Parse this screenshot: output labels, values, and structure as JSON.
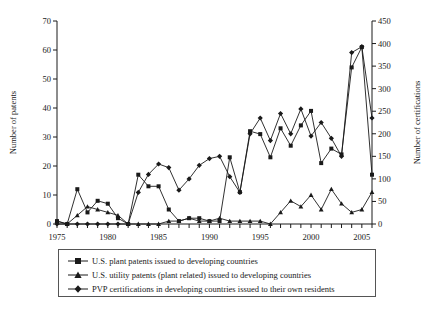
{
  "chart_data": {
    "type": "line",
    "title": "",
    "xlabel": "",
    "ylabel": "Number of patents",
    "y2label": "Number of certifications",
    "xlim": [
      1975,
      2006
    ],
    "ylim": [
      0,
      70
    ],
    "y2lim": [
      0,
      450
    ],
    "grid": false,
    "legend_position": "bottom",
    "xticks": [
      1975,
      1980,
      1985,
      1990,
      1995,
      2000,
      2005
    ],
    "xtick_labels": [
      "1975",
      "1980",
      "1985",
      "1990",
      "1995",
      "2000",
      "2005"
    ],
    "yticks": [
      0,
      10,
      20,
      30,
      40,
      50,
      60,
      70
    ],
    "ytick_labels": [
      "0",
      "10",
      "20",
      "30",
      "40",
      "50",
      "60",
      "70"
    ],
    "y2ticks": [
      0,
      50,
      100,
      150,
      200,
      250,
      300,
      350,
      400,
      450
    ],
    "y2tick_labels": [
      "0",
      "50",
      "100",
      "150",
      "200",
      "250",
      "300",
      "350",
      "400",
      "450"
    ],
    "x": [
      1975,
      1976,
      1977,
      1978,
      1979,
      1980,
      1981,
      1982,
      1983,
      1984,
      1985,
      1986,
      1987,
      1988,
      1989,
      1990,
      1991,
      1992,
      1993,
      1994,
      1995,
      1996,
      1997,
      1998,
      1999,
      2000,
      2001,
      2002,
      2003,
      2004,
      2005,
      2006
    ],
    "series": [
      {
        "name": "U.S. plant patents issued to developing countries",
        "marker": "square",
        "axis": "left",
        "values": [
          1,
          0,
          12,
          4,
          8,
          7,
          2,
          0,
          17,
          13,
          13,
          5,
          1,
          2,
          2,
          1,
          1,
          23,
          11,
          32,
          31,
          23,
          33,
          27,
          34,
          39,
          21,
          26,
          24,
          54,
          61,
          17
        ]
      },
      {
        "name": "U.S. utility patents (plant related)  issued to developing countries",
        "marker": "triangle",
        "axis": "left",
        "values": [
          1,
          0,
          3,
          6,
          5,
          4,
          3,
          0,
          0,
          0,
          0,
          1,
          1,
          2,
          1,
          1,
          2,
          1,
          1,
          1,
          1,
          0,
          4,
          8,
          6,
          10,
          5,
          12,
          7,
          4,
          5,
          11
        ]
      },
      {
        "name": "PVP certifications in developing countries issued to their own residents",
        "marker": "diamond",
        "axis": "right",
        "values": [
          0,
          0,
          0,
          0,
          0,
          0,
          0,
          0,
          70,
          110,
          133,
          125,
          75,
          100,
          130,
          145,
          150,
          105,
          70,
          200,
          235,
          185,
          245,
          200,
          255,
          195,
          225,
          190,
          150,
          380,
          393,
          235
        ]
      }
    ]
  },
  "legend": {
    "items": [
      {
        "label": "U.S. plant patents issued to developing countries",
        "marker": "square"
      },
      {
        "label": "U.S. utility patents (plant related)  issued to developing countries",
        "marker": "triangle"
      },
      {
        "label": "PVP certifications in developing countries issued to their own residents",
        "marker": "diamond"
      }
    ]
  },
  "colors": {
    "line": "#1a1a1a",
    "axis": "#1a1a1a",
    "background": "#ffffff"
  }
}
